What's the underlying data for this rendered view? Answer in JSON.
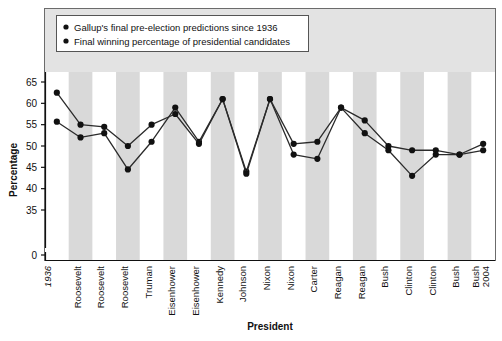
{
  "chart_data": {
    "type": "line",
    "title": "",
    "xlabel": "President",
    "ylabel": "Percentage",
    "ylim": [
      33,
      67
    ],
    "yticks": [
      0,
      35,
      40,
      45,
      50,
      55,
      60,
      65
    ],
    "ytick_labels": [
      "0",
      "35",
      "40",
      "45",
      "50",
      "55",
      "60",
      "65"
    ],
    "grid": false,
    "axis_break": true,
    "legend_position": "top-left-inside",
    "categories": [
      "1936",
      "Roosevelt",
      "Roosevelt",
      "Roosevelt",
      "Truman",
      "Eisenhower",
      "Eisenhower",
      "Kennedy",
      "Johnson",
      "Nixon",
      "Nixon",
      "Carter",
      "Reagan",
      "Reagan",
      "Bush",
      "Clinton",
      "Clinton",
      "Bush",
      "Bush 2004"
    ],
    "series": [
      {
        "name": "Gallup's final pre-election predictions since 1936",
        "values": [
          55.7,
          52.0,
          53.0,
          44.5,
          51.0,
          59.0,
          51.0,
          61.0,
          44.0,
          61.0,
          48.0,
          47.0,
          59.0,
          53.0,
          49.0,
          43.0,
          48.0,
          48.0,
          49.0
        ],
        "color": "#1a1a1a",
        "marker": "circle"
      },
      {
        "name": "Final winning percentage of presidential candidates",
        "values": [
          62.5,
          55.0,
          54.5,
          50.0,
          55.0,
          57.5,
          50.5,
          61.0,
          43.5,
          61.0,
          50.5,
          51.0,
          59.0,
          56.0,
          50.0,
          49.0,
          49.0,
          48.0,
          50.5
        ],
        "color": "#1a1a1a",
        "marker": "circle"
      }
    ]
  },
  "legend": {
    "items": [
      {
        "marker": "bullet",
        "label": "Gallup's final pre-election predictions since 1936"
      },
      {
        "marker": "bullet",
        "label": "Final winning percentage of presidential candidates"
      }
    ]
  },
  "colors": {
    "line": "#2b2b2b",
    "marker": "#111111",
    "stripe": "#d9d9d9",
    "plot_background": "#ffffff",
    "legend_band": "#e3e3e3",
    "frame": "#6b6b6b",
    "axis": "#111111"
  }
}
